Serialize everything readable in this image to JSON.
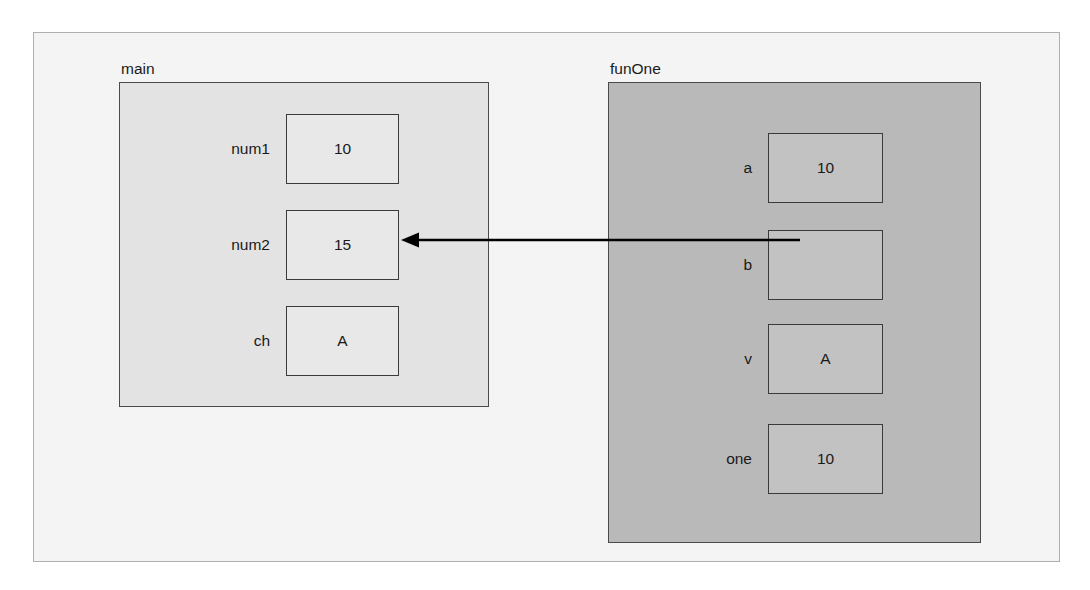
{
  "diagram": {
    "title": "",
    "colors": {
      "page_background": "#ffffff",
      "frame_background": "#f4f4f4",
      "frame_border": "#b0b0b0",
      "main_scope_fill": "#e3e3e3",
      "funone_scope_fill": "#b9b9b9",
      "main_cell_fill": "#e8e8e8",
      "funone_cell_fill": "#c2c2c2",
      "box_border": "#3a3a3a",
      "text": "#1a1a1a",
      "arrow": "#000000"
    },
    "scopes": [
      {
        "id": "main",
        "label": "main",
        "variables": [
          {
            "name": "num1",
            "value": "10"
          },
          {
            "name": "num2",
            "value": "15"
          },
          {
            "name": "ch",
            "value": "A"
          }
        ]
      },
      {
        "id": "funOne",
        "label": "funOne",
        "variables": [
          {
            "name": "a",
            "value": "10"
          },
          {
            "name": "b",
            "value": ""
          },
          {
            "name": "v",
            "value": "A"
          },
          {
            "name": "one",
            "value": "10"
          }
        ]
      }
    ],
    "arrow": {
      "name": "reference-arrow",
      "from_scope": "funOne",
      "from_variable": "b",
      "to_scope": "main",
      "to_variable": "num2",
      "direction": "right-to-left",
      "head": "left"
    }
  }
}
